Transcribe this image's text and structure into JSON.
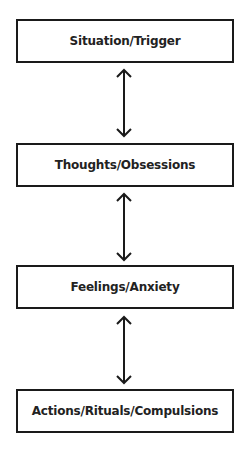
{
  "diagram": {
    "type": "vertical-flow",
    "nodes": [
      {
        "id": "situation",
        "label": "Situation/Trigger"
      },
      {
        "id": "thoughts",
        "label": "Thoughts/Obsessions"
      },
      {
        "id": "feelings",
        "label": "Feelings/Anxiety"
      },
      {
        "id": "actions",
        "label": "Actions/Rituals/Compulsions"
      }
    ],
    "edges": [
      {
        "from": "situation",
        "to": "thoughts",
        "direction": "bidirectional"
      },
      {
        "from": "thoughts",
        "to": "feelings",
        "direction": "bidirectional"
      },
      {
        "from": "feelings",
        "to": "actions",
        "direction": "bidirectional"
      }
    ],
    "colors": {
      "stroke": "#1a1a1a",
      "text": "#222222",
      "background": "#ffffff"
    }
  }
}
